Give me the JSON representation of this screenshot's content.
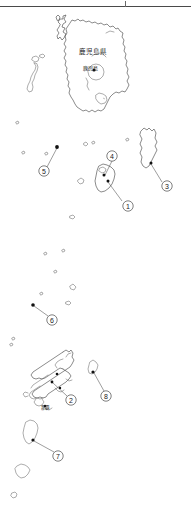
{
  "page": {
    "background_color": "#ffffff",
    "line_color": "#3c3c3c",
    "marker_color": "#111111",
    "width": 191,
    "height": 505
  },
  "rule": {
    "name": "top-horizontal-rule",
    "color": "#4a4a4a"
  },
  "labels": {
    "prefecture": "鹿児島県",
    "kagoshima_city": "鹿児島",
    "naha": "那覇"
  },
  "callouts": [
    {
      "id": "1",
      "number": "①",
      "circle_x": 128,
      "circle_y": 206,
      "marker_x": 108,
      "marker_y": 181,
      "region": "tanegashima-yakushima"
    },
    {
      "id": "2",
      "number": "②",
      "circle_x": 71,
      "circle_y": 400,
      "marker_x": 52,
      "marker_y": 382,
      "region": "okinawa-main-island"
    },
    {
      "id": "3",
      "number": "③",
      "circle_x": 167,
      "circle_y": 186,
      "marker_x": 151,
      "marker_y": 163,
      "region": "amami-oshima"
    },
    {
      "id": "4",
      "number": "④",
      "circle_x": 112,
      "circle_y": 156,
      "marker_x": 104,
      "marker_y": 175,
      "region": "yakushima"
    },
    {
      "id": "5",
      "number": "⑤",
      "circle_x": 44,
      "circle_y": 171,
      "marker_x": 57,
      "marker_y": 147,
      "region": "koshikijima"
    },
    {
      "id": "6",
      "number": "⑥",
      "circle_x": 52,
      "circle_y": 320,
      "marker_x": 33,
      "marker_y": 305,
      "region": "kume-okinoerabu"
    },
    {
      "id": "7",
      "number": "⑦",
      "circle_x": 58,
      "circle_y": 456,
      "marker_x": 33,
      "marker_y": 440,
      "region": "ishigaki-miyako"
    },
    {
      "id": "8",
      "number": "⑧",
      "circle_x": 106,
      "circle_y": 396,
      "marker_x": 93,
      "marker_y": 372,
      "region": "kume-island"
    }
  ],
  "point_markers": [
    {
      "name": "kagoshima-city-marker",
      "x": 94,
      "y": 70
    },
    {
      "name": "tanegashima-marker",
      "x": 108,
      "y": 181
    },
    {
      "name": "yakushima-marker",
      "x": 104,
      "y": 175
    },
    {
      "name": "koshikijima-marker",
      "x": 57,
      "y": 147
    },
    {
      "name": "amami-marker",
      "x": 151,
      "y": 163
    },
    {
      "name": "okinoerabu-marker",
      "x": 33,
      "y": 305
    },
    {
      "name": "okinawa-marker",
      "x": 52,
      "y": 382
    },
    {
      "name": "naha-marker",
      "x": 45,
      "y": 406
    },
    {
      "name": "kume-marker",
      "x": 93,
      "y": 372
    },
    {
      "name": "ishigaki-marker",
      "x": 33,
      "y": 440
    },
    {
      "name": "okinawa-secondary-marker",
      "x": 60,
      "y": 388
    },
    {
      "name": "okinawa-north-marker",
      "x": 57,
      "y": 374
    }
  ],
  "islands": [
    {
      "name": "kyushu-kagoshima-mainland",
      "type": "large-outline"
    },
    {
      "name": "koshikijima-islands",
      "type": "small-chain"
    },
    {
      "name": "tanegashima",
      "type": "medium-outline"
    },
    {
      "name": "yakushima",
      "type": "medium-outline"
    },
    {
      "name": "amami-oshima",
      "type": "medium-outline"
    },
    {
      "name": "tokara-islands",
      "type": "specks"
    },
    {
      "name": "okinawa-main-island",
      "type": "complex-outline"
    },
    {
      "name": "kume-island",
      "type": "small-outline"
    },
    {
      "name": "ishigaki-island",
      "type": "small-outline"
    },
    {
      "name": "miyako-island",
      "type": "small-outline"
    },
    {
      "name": "yonaguni-island",
      "type": "speck"
    }
  ]
}
